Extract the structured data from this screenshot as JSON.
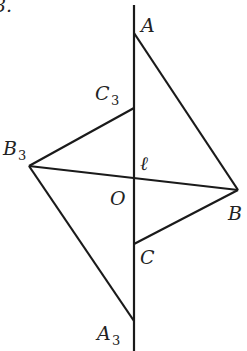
{
  "figure": {
    "partial_text": "3.",
    "axis_label": "ℓ",
    "stroke_color": "#1a1a1a",
    "points": {
      "A": {
        "label": "A",
        "sub": ""
      },
      "B": {
        "label": "B",
        "sub": ""
      },
      "C": {
        "label": "C",
        "sub": ""
      },
      "O": {
        "label": "O",
        "sub": ""
      },
      "A3": {
        "label": "A",
        "sub": "3"
      },
      "B3": {
        "label": "B",
        "sub": "3"
      },
      "C3": {
        "label": "C",
        "sub": "3"
      }
    }
  }
}
